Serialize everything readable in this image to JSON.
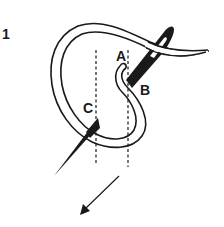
{
  "diagram": {
    "step_number": "1",
    "points": {
      "a": "A",
      "b": "B",
      "c": "C"
    },
    "elements": [
      {
        "name": "thread-loop",
        "type": "double-line-curve"
      },
      {
        "name": "needle-upper",
        "type": "needle",
        "position": "through point B with eye at top right"
      },
      {
        "name": "needle-lower",
        "type": "needle-tip",
        "position": "emerging at point C pointing down-left"
      },
      {
        "name": "guide-line-left",
        "type": "dashed-vertical"
      },
      {
        "name": "guide-line-right",
        "type": "dashed-vertical"
      },
      {
        "name": "direction-arrow",
        "type": "arrow",
        "direction": "down-left"
      }
    ],
    "colors": {
      "ink": "#1a1a1a",
      "background": "#ffffff"
    }
  }
}
